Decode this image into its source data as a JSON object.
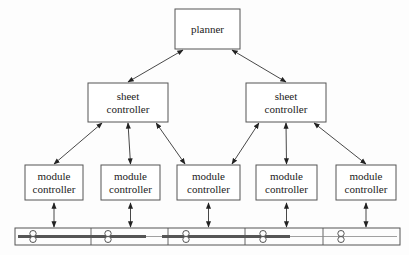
{
  "diagram": {
    "nodes": {
      "planner": {
        "label_lines": [
          "planner"
        ],
        "x": 175,
        "y": 9,
        "w": 65,
        "h": 40
      },
      "sheet_left": {
        "label_lines": [
          "sheet",
          "controller"
        ],
        "x": 88,
        "y": 83,
        "w": 80,
        "h": 39
      },
      "sheet_right": {
        "label_lines": [
          "sheet",
          "controller"
        ],
        "x": 246,
        "y": 83,
        "w": 80,
        "h": 39
      },
      "modules": [
        {
          "label_lines": [
            "module",
            "controller"
          ],
          "x": 25,
          "y": 165,
          "w": 58,
          "h": 35
        },
        {
          "label_lines": [
            "module",
            "controller"
          ],
          "x": 101,
          "y": 165,
          "w": 59,
          "h": 35
        },
        {
          "label_lines": [
            "module",
            "controller"
          ],
          "x": 177,
          "y": 165,
          "w": 63,
          "h": 35
        },
        {
          "label_lines": [
            "module",
            "controller"
          ],
          "x": 256,
          "y": 165,
          "w": 61,
          "h": 35
        },
        {
          "label_lines": [
            "module",
            "controller"
          ],
          "x": 336,
          "y": 165,
          "w": 60,
          "h": 35
        }
      ]
    },
    "edges": [
      {
        "from": "planner",
        "to": "sheet_left",
        "type": "bidirectional"
      },
      {
        "from": "planner",
        "to": "sheet_right",
        "type": "bidirectional"
      },
      {
        "from": "sheet_left",
        "to": "module_1",
        "type": "bidirectional"
      },
      {
        "from": "sheet_left",
        "to": "module_2",
        "type": "bidirectional"
      },
      {
        "from": "sheet_left",
        "to": "module_3",
        "type": "bidirectional"
      },
      {
        "from": "sheet_right",
        "to": "module_3",
        "type": "bidirectional"
      },
      {
        "from": "sheet_right",
        "to": "module_4",
        "type": "bidirectional"
      },
      {
        "from": "sheet_right",
        "to": "module_5",
        "type": "bidirectional"
      },
      {
        "from": "module_1",
        "to": "paper_path",
        "type": "bidirectional"
      },
      {
        "from": "module_2",
        "to": "paper_path",
        "type": "bidirectional"
      },
      {
        "from": "module_3",
        "to": "paper_path",
        "type": "bidirectional"
      },
      {
        "from": "module_4",
        "to": "paper_path",
        "type": "bidirectional"
      },
      {
        "from": "module_5",
        "to": "paper_path",
        "type": "bidirectional"
      }
    ],
    "paper_path": {
      "x": 15,
      "y": 228,
      "w": 385,
      "h": 17,
      "dividers": [
        91,
        168,
        245,
        323
      ],
      "sheets": [
        {
          "x1": 18,
          "x2": 146
        },
        {
          "x1": 162,
          "x2": 290
        }
      ],
      "rollers": [
        33,
        108,
        186,
        263,
        341
      ]
    },
    "colors": {
      "line": "#333333",
      "box_border": "#555555",
      "sheet": "#555555"
    }
  }
}
